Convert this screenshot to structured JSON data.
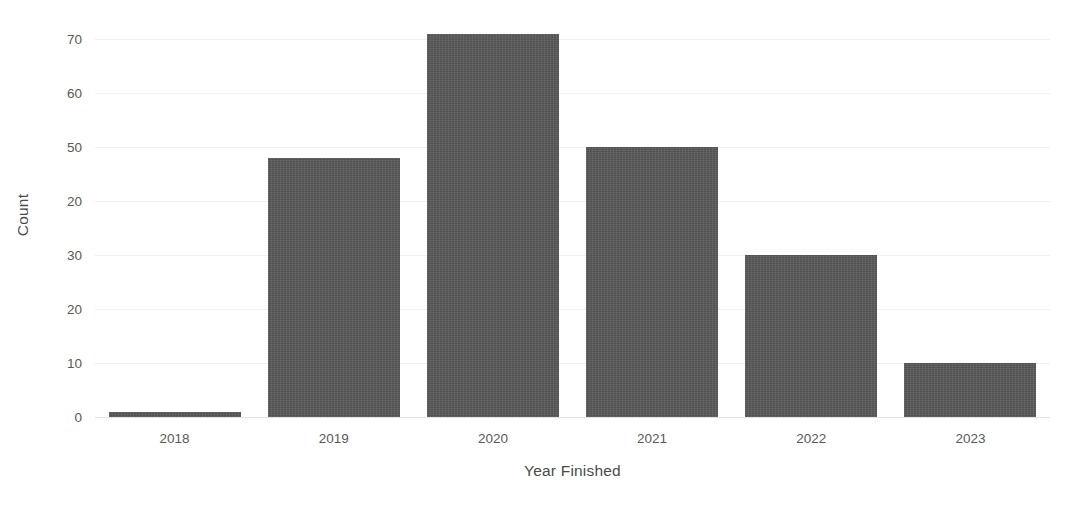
{
  "chart_data": {
    "type": "bar",
    "title": "",
    "subtitle": "",
    "xlabel": "Year Finished",
    "ylabel": "Count",
    "categories": [
      "2018",
      "2019",
      "2020",
      "2021",
      "2022",
      "2023"
    ],
    "values": [
      1,
      48,
      71,
      50,
      30,
      10
    ],
    "series": [
      {
        "name": "Count",
        "values": [
          1,
          48,
          71,
          50,
          30,
          10
        ]
      }
    ],
    "ylim": [
      0,
      70
    ],
    "y_tick_values": [
      70,
      60,
      50,
      40,
      30,
      20,
      10,
      0
    ],
    "y_tick_labels": [
      "70",
      "60",
      "50",
      "20",
      "30",
      "20",
      "10",
      "0"
    ],
    "x_tick_labels": [
      "2018",
      "2019",
      "2020",
      "2021",
      "2022",
      "2023"
    ],
    "grid": true,
    "grid_axis": "y",
    "legend": false,
    "legend_position": "none",
    "bar_color": "#595959",
    "gridline_color": "#f0f0f0",
    "axis_text_color": "#595959",
    "background_color": "#ffffff"
  }
}
